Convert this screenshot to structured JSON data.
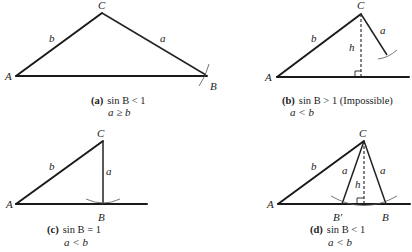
{
  "panels": [
    {
      "id": "a",
      "tag": "(a)",
      "condition": "sin B < 1",
      "relation": "a ≥ b",
      "vertices": {
        "A": "A",
        "B": "B",
        "C": "C"
      },
      "sides": {
        "a": "a",
        "b": "b"
      }
    },
    {
      "id": "b",
      "tag": "(b)",
      "condition": "sin B > 1 (Impossible)",
      "relation": "a < b",
      "vertices": {
        "A": "A",
        "C": "C"
      },
      "sides": {
        "a": "a",
        "b": "b",
        "h": "h"
      }
    },
    {
      "id": "c",
      "tag": "(c)",
      "condition": "sin B = 1",
      "relation": "a < b",
      "vertices": {
        "A": "A",
        "B": "B",
        "C": "C"
      },
      "sides": {
        "a": "a",
        "b": "b"
      }
    },
    {
      "id": "d",
      "tag": "(d)",
      "condition": "sin B < 1",
      "relation": "a < b",
      "vertices": {
        "A": "A",
        "B": "B",
        "B_prime": "B′",
        "C": "C"
      },
      "sides": {
        "a": "a",
        "b": "b",
        "h": "h"
      }
    }
  ]
}
